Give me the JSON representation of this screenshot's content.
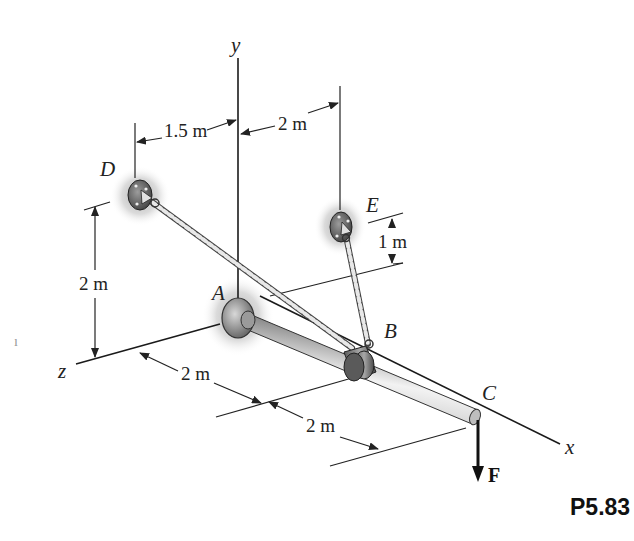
{
  "figure": {
    "id": "P5.83"
  },
  "axes": {
    "x": "x",
    "y": "y",
    "z": "z"
  },
  "points": {
    "A": "A",
    "B": "B",
    "C": "C",
    "D": "D",
    "E": "E"
  },
  "force": {
    "label": "F",
    "direction": "down",
    "at": "C"
  },
  "dimensions": {
    "d_D_to_y": "1.5 m",
    "d_y_to_E": "2 m",
    "d_D_height": "2 m",
    "d_E_height": "1 m",
    "d_A_to_B": "2 m",
    "d_B_to_C": "2 m"
  },
  "colors": {
    "line": "#222222",
    "rod_light": "#e6e6e6",
    "rod_dark": "#7a7a7a",
    "shadow": "#bdbdbd"
  }
}
